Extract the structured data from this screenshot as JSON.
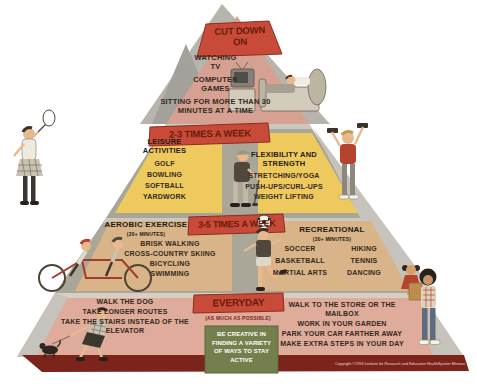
{
  "poster": {
    "sections": {
      "cut_down_on": {
        "banner": "CUT DOWN ON",
        "items": [
          "WATCHING TV",
          "COMPUTER GAMES",
          "SITTING FOR MORE THAN 30 MINUTES AT A TIME"
        ]
      },
      "two_three_times_week": {
        "banner": "2-3 TIMES A WEEK",
        "leisure": {
          "title": "LEISURE ACTIVITIES",
          "items": [
            "GOLF",
            "BOWLING",
            "SOFTBALL",
            "YARDWORK"
          ]
        },
        "flexibility": {
          "title": "FLEXIBILITY AND STRENGTH",
          "items": [
            "STRETCHING/YOGA",
            "PUSH-UPS/CURL-UPS",
            "WEIGHT LIFTING"
          ]
        }
      },
      "three_five_times_week": {
        "banner": "3-5 TIMES A WEEK",
        "aerobic": {
          "title": "AEROBIC EXERCISE",
          "subtitle": "(20+ MINUTES)",
          "items": [
            "BRISK WALKING",
            "CROSS-COUNTRY SKIING",
            "BICYCLING",
            "SWIMMING"
          ]
        },
        "recreational": {
          "title": "RECREATIONAL",
          "subtitle": "(30+ MINUTES)",
          "col1": [
            "SOCCER",
            "BASKETBALL",
            "MARTIAL ARTS"
          ],
          "col2": [
            "HIKING",
            "TENNIS",
            "DANCING"
          ]
        }
      },
      "everyday": {
        "banner": "EVERYDAY",
        "subtitle": "(AS MUCH AS POSSIBLE)",
        "left_items": [
          "WALK THE DOG",
          "TAKE LONGER ROUTES",
          "TAKE THE STAIRS INSTEAD OF THE ELEVATOR"
        ],
        "right_items": [
          "WALK TO THE STORE OR THE MAILBOX",
          "WORK IN YOUR GARDEN",
          "PARK YOUR CAR FARTHER AWAY",
          "MAKE EXTRA STEPS IN YOUR DAY"
        ],
        "creative_box": "BE CREATIVE IN FINDING A VARIETY OF WAYS TO STAY ACTIVE"
      }
    },
    "footer": {
      "copyright": "Copyright ©1996 Institute for Research and Education HealthSystem Minnesota"
    },
    "illustrations": [
      "tv-bed",
      "badminton-player",
      "golfer",
      "weight-lifter",
      "tandem-cyclists",
      "soccer-player",
      "watching-girl",
      "dog-walker",
      "grocery-walker"
    ],
    "colors": {
      "banner_red": "#c74b38",
      "banner_text": "#6e1a0d",
      "top_band_pink": "#d6a192",
      "panel_yellow": "#eec95d",
      "panel_tan": "#d9b488",
      "band_olive": "#a9a597",
      "bottom_band_pink": "#dfab9a",
      "creative_green": "#73804e",
      "base_maroon": "#7c241c",
      "text_dark": "#33291e"
    }
  }
}
